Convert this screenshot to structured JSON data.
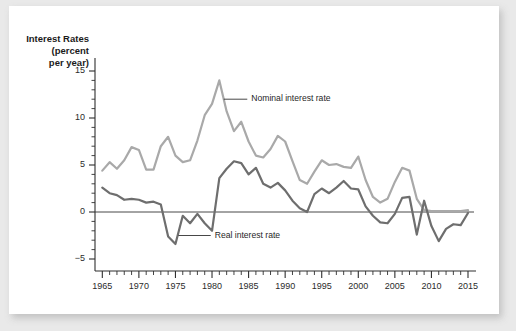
{
  "chart_data": {
    "type": "line",
    "title": "",
    "xlabel": "",
    "ylabel": "Interest Rates (percent per year)",
    "ylabel_lines": [
      "Interest Rates",
      "(percent",
      "per year)"
    ],
    "xlim": [
      1964,
      2015
    ],
    "ylim": [
      -5,
      15
    ],
    "grid": false,
    "legend_position": "inline-annotations",
    "yticks": [
      -5,
      0,
      5,
      10,
      15
    ],
    "ytick_labels": [
      "−5",
      "0",
      "5",
      "10",
      "15"
    ],
    "xticks": [
      1965,
      1970,
      1975,
      1980,
      1985,
      1990,
      1995,
      2000,
      2005,
      2010,
      2015
    ],
    "xtick_labels": [
      "1965",
      "1970",
      "1975",
      "1980",
      "1985",
      "1990",
      "1995",
      "2000",
      "2005",
      "2010",
      "2015"
    ],
    "minor_xtick_interval": 1,
    "zero_line": 0,
    "annotations": [
      {
        "text": "Nominal interest rate",
        "x": 1984.0,
        "y": 12.0,
        "leader_to_x": 1981.6,
        "series": "Nominal interest rate"
      },
      {
        "text": "Real interest rate",
        "x": 1979.0,
        "y": -2.5,
        "leader_to_x": 1975.4,
        "series": "Real interest rate"
      }
    ],
    "x": [
      1965,
      1966,
      1967,
      1968,
      1969,
      1970,
      1971,
      1972,
      1973,
      1974,
      1975,
      1976,
      1977,
      1978,
      1979,
      1980,
      1981,
      1982,
      1983,
      1984,
      1985,
      1986,
      1987,
      1988,
      1989,
      1990,
      1991,
      1992,
      1993,
      1994,
      1995,
      1996,
      1997,
      1998,
      1999,
      2000,
      2001,
      2002,
      2003,
      2004,
      2005,
      2006,
      2007,
      2008,
      2009,
      2010,
      2011,
      2012,
      2013,
      2014,
      2015
    ],
    "series": [
      {
        "name": "Nominal interest rate",
        "color": "#a9a9a9",
        "values": [
          4.4,
          5.3,
          4.6,
          5.5,
          6.9,
          6.6,
          4.5,
          4.5,
          7.0,
          8.0,
          6.0,
          5.3,
          5.5,
          7.6,
          10.3,
          11.5,
          14.0,
          10.7,
          8.6,
          9.6,
          7.5,
          6.0,
          5.8,
          6.7,
          8.1,
          7.5,
          5.4,
          3.4,
          3.0,
          4.3,
          5.5,
          5.0,
          5.1,
          4.8,
          4.7,
          5.9,
          3.4,
          1.6,
          1.0,
          1.4,
          3.2,
          4.7,
          4.4,
          1.4,
          0.2,
          0.1,
          0.1,
          0.1,
          0.1,
          0.1,
          0.2
        ]
      },
      {
        "name": "Real interest rate",
        "color": "#6e6e6e",
        "values": [
          2.6,
          2.0,
          1.8,
          1.3,
          1.4,
          1.3,
          1.0,
          1.1,
          0.8,
          -2.6,
          -3.4,
          -0.4,
          -1.2,
          -0.2,
          -1.2,
          -2.0,
          3.6,
          4.6,
          5.4,
          5.2,
          4.0,
          4.7,
          3.0,
          2.6,
          3.1,
          2.3,
          1.2,
          0.4,
          0.0,
          1.9,
          2.5,
          2.0,
          2.6,
          3.3,
          2.5,
          2.4,
          0.6,
          -0.4,
          -1.1,
          -1.2,
          -0.2,
          1.5,
          1.6,
          -2.4,
          1.2,
          -1.5,
          -3.1,
          -1.8,
          -1.3,
          -1.4,
          -0.1
        ]
      }
    ]
  }
}
